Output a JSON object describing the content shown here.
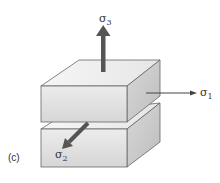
{
  "figure": {
    "panel_label": "(c)",
    "colors": {
      "background": "#ffffff",
      "face_front": "#e2e2e2",
      "face_top": "#f2f2f2",
      "face_side": "#cfcfcf",
      "edge": "#555555",
      "arrow": "#555555",
      "arrow_thin": "#444444",
      "text": "#333333"
    },
    "blocks": [
      {
        "name": "upper-block"
      },
      {
        "name": "lower-block"
      }
    ],
    "stresses": [
      {
        "id": "sigma3",
        "symbol": "σ",
        "subscript": "3",
        "direction": "up",
        "style": "thick"
      },
      {
        "id": "sigma1",
        "symbol": "σ",
        "subscript": "1",
        "direction": "right",
        "style": "thin"
      },
      {
        "id": "sigma2",
        "symbol": "σ",
        "subscript": "2",
        "direction": "front-left",
        "style": "thick"
      }
    ]
  }
}
